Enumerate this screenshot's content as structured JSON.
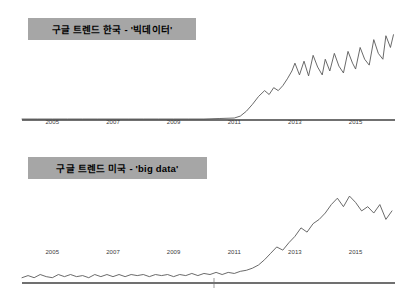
{
  "page": {
    "background_color": "#ffffff",
    "width": 407,
    "height": 285
  },
  "style": {
    "title_box_color": "#a6a6a6",
    "line_color": "#595959",
    "axis_color": "#404040",
    "tick_label_color": "#3a3a3a"
  },
  "charts": [
    {
      "id": "korea",
      "title": "구글 트렌드 한국 - '빅데이터'"
    },
    {
      "id": "usa",
      "title": "구글 트렌드 미국 - 'big data'"
    }
  ],
  "chart_data": [
    {
      "type": "line",
      "title": "구글 트렌드 한국 - '빅데이터'",
      "xlabel": "",
      "ylabel": "",
      "grid": false,
      "legend": false,
      "xlim": [
        2004.0,
        2016.3
      ],
      "ylim": [
        0,
        100
      ],
      "tick_labels": [
        "2005",
        "2007",
        "2009",
        "2011",
        "2013",
        "2015"
      ],
      "tick_values": [
        2005,
        2007,
        2009,
        2011,
        2013,
        2015
      ],
      "series": [
        {
          "name": "빅데이터 (Korea)",
          "x": [
            2004.0,
            2004.5,
            2005.0,
            2005.5,
            2006.0,
            2006.5,
            2007.0,
            2007.5,
            2008.0,
            2008.5,
            2009.0,
            2009.5,
            2010.0,
            2010.5,
            2011.0,
            2011.2,
            2011.4,
            2011.6,
            2011.8,
            2012.0,
            2012.15,
            2012.3,
            2012.45,
            2012.6,
            2012.75,
            2012.9,
            2013.0,
            2013.15,
            2013.3,
            2013.45,
            2013.6,
            2013.75,
            2013.9,
            2014.0,
            2014.15,
            2014.3,
            2014.45,
            2014.6,
            2014.75,
            2014.9,
            2015.0,
            2015.15,
            2015.3,
            2015.45,
            2015.6,
            2015.75,
            2015.9,
            2016.0,
            2016.15,
            2016.25
          ],
          "y": [
            1,
            1,
            1,
            1,
            1,
            1,
            1,
            1,
            1,
            1,
            1,
            1,
            1,
            1.5,
            2,
            4,
            9,
            16,
            24,
            30,
            26,
            33,
            30,
            35,
            42,
            50,
            58,
            46,
            60,
            45,
            66,
            54,
            46,
            62,
            50,
            68,
            55,
            48,
            70,
            58,
            52,
            74,
            62,
            56,
            82,
            68,
            62,
            86,
            74,
            87
          ]
        }
      ]
    },
    {
      "type": "line",
      "title": "구글 트렌드 미국 - 'big data'",
      "xlabel": "",
      "ylabel": "",
      "grid": false,
      "legend": false,
      "xlim": [
        2004.0,
        2016.3
      ],
      "ylim": [
        0,
        100
      ],
      "tick_labels": [
        "2005",
        "2007",
        "2009",
        "2011",
        "2013",
        "2015"
      ],
      "tick_values": [
        2005,
        2007,
        2009,
        2011,
        2013,
        2015
      ],
      "series": [
        {
          "name": "big data (USA)",
          "x": [
            2004.0,
            2004.2,
            2004.4,
            2004.6,
            2004.8,
            2005.0,
            2005.2,
            2005.4,
            2005.6,
            2005.8,
            2006.0,
            2006.2,
            2006.4,
            2006.6,
            2006.8,
            2007.0,
            2007.2,
            2007.4,
            2007.6,
            2007.8,
            2008.0,
            2008.2,
            2008.4,
            2008.6,
            2008.8,
            2009.0,
            2009.2,
            2009.4,
            2009.6,
            2009.8,
            2010.0,
            2010.2,
            2010.4,
            2010.6,
            2010.8,
            2011.0,
            2011.2,
            2011.4,
            2011.6,
            2011.8,
            2012.0,
            2012.2,
            2012.4,
            2012.6,
            2012.8,
            2013.0,
            2013.2,
            2013.4,
            2013.6,
            2013.8,
            2014.0,
            2014.2,
            2014.4,
            2014.6,
            2014.8,
            2015.0,
            2015.2,
            2015.4,
            2015.6,
            2015.8,
            2016.0,
            2016.2
          ],
          "y": [
            5,
            7,
            5,
            8,
            6,
            5,
            8,
            6,
            8,
            6,
            7,
            5,
            8,
            6,
            8,
            6,
            8,
            6,
            8,
            7,
            8,
            6,
            8,
            7,
            8,
            6,
            8,
            7,
            9,
            7,
            9,
            8,
            10,
            8,
            10,
            9,
            11,
            12,
            14,
            17,
            22,
            28,
            34,
            31,
            38,
            44,
            52,
            48,
            56,
            60,
            66,
            74,
            80,
            72,
            82,
            76,
            68,
            72,
            66,
            74,
            60,
            68
          ]
        }
      ]
    }
  ]
}
